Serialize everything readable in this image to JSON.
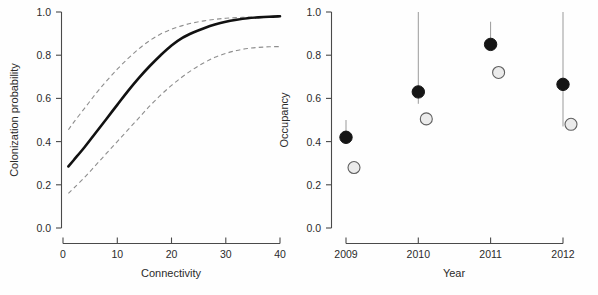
{
  "figure": {
    "background": "#fefefe",
    "panels": [
      "colonization-panel",
      "occupancy-panel"
    ]
  },
  "chart_data": [
    {
      "type": "line",
      "panel": "left",
      "title": "",
      "xlabel": "Connectivity",
      "ylabel": "Colonization probability",
      "xlim": [
        0,
        40
      ],
      "ylim": [
        0,
        1
      ],
      "xticks": [
        0,
        10,
        20,
        30,
        40
      ],
      "xtick_labels": [
        "0",
        "10",
        "20",
        "30",
        "40"
      ],
      "yticks": [
        0.0,
        0.2,
        0.4,
        0.6,
        0.8,
        1.0
      ],
      "ytick_labels": [
        "0.0",
        "0.2",
        "0.4",
        "0.6",
        "0.8",
        "1.0"
      ],
      "grid": false,
      "legend": "none",
      "series": [
        {
          "name": "fitted colonization probability",
          "style": "solid",
          "color": "#111111",
          "x": [
            1,
            2,
            4,
            6,
            8,
            10,
            12,
            14,
            16,
            18,
            20,
            22,
            24,
            26,
            28,
            30,
            32,
            34,
            36,
            38,
            40
          ],
          "y": [
            0.285,
            0.315,
            0.375,
            0.44,
            0.505,
            0.57,
            0.635,
            0.695,
            0.75,
            0.8,
            0.845,
            0.88,
            0.905,
            0.925,
            0.942,
            0.955,
            0.964,
            0.971,
            0.975,
            0.978,
            0.98
          ]
        },
        {
          "name": "upper 95% confidence limit",
          "style": "dashed",
          "color": "#8e8e8e",
          "x": [
            1,
            2,
            4,
            6,
            8,
            10,
            12,
            14,
            16,
            18,
            20,
            22,
            24,
            26,
            28,
            30,
            32,
            34,
            36,
            38,
            40
          ],
          "y": [
            0.455,
            0.49,
            0.555,
            0.62,
            0.68,
            0.735,
            0.785,
            0.83,
            0.868,
            0.898,
            0.92,
            0.937,
            0.95,
            0.959,
            0.966,
            0.971,
            0.974,
            0.976,
            0.978,
            0.979,
            0.98
          ]
        },
        {
          "name": "lower 95% confidence limit",
          "style": "dashed",
          "color": "#8e8e8e",
          "x": [
            1,
            2,
            4,
            6,
            8,
            10,
            12,
            14,
            16,
            18,
            20,
            22,
            24,
            26,
            28,
            30,
            32,
            34,
            36,
            38,
            40
          ],
          "y": [
            0.16,
            0.185,
            0.235,
            0.29,
            0.345,
            0.4,
            0.455,
            0.51,
            0.565,
            0.615,
            0.66,
            0.7,
            0.735,
            0.765,
            0.79,
            0.808,
            0.822,
            0.831,
            0.836,
            0.839,
            0.84
          ]
        }
      ]
    },
    {
      "type": "scatter",
      "panel": "right",
      "title": "",
      "xlabel": "Year",
      "ylabel": "Occupancy",
      "categories": [
        "2009",
        "2010",
        "2011",
        "2012"
      ],
      "xtick_labels": [
        "2009",
        "2010",
        "2011",
        "2012"
      ],
      "ylim": [
        0,
        1
      ],
      "yticks": [
        0.0,
        0.2,
        0.4,
        0.6,
        0.8,
        1.0
      ],
      "ytick_labels": [
        "0.0",
        "0.2",
        "0.4",
        "0.6",
        "0.8",
        "1.0"
      ],
      "grid": false,
      "legend": "none",
      "series": [
        {
          "name": "estimated occupancy",
          "marker": "filled-circle",
          "color": "#151515",
          "values": [
            0.42,
            0.63,
            0.85,
            0.665
          ],
          "error_low": [
            0.395,
            0.575,
            0.825,
            0.47
          ],
          "error_high": [
            0.5,
            1.0,
            0.955,
            1.0
          ]
        },
        {
          "name": "naive occupancy",
          "marker": "open-circle",
          "color": "#ebebeb",
          "values": [
            0.28,
            0.505,
            0.72,
            0.48
          ]
        }
      ]
    }
  ],
  "left_panel": {
    "y_axis_title": "Colonization probability",
    "x_axis_title": "Connectivity",
    "y_tick_labels": [
      "1.0",
      "0.8",
      "0.6",
      "0.4",
      "0.2",
      "0.0"
    ],
    "x_tick_labels": [
      "0",
      "10",
      "20",
      "30",
      "40"
    ]
  },
  "right_panel": {
    "y_axis_title": "Occupancy",
    "x_axis_title": "Year",
    "y_tick_labels": [
      "1.0",
      "0.8",
      "0.6",
      "0.4",
      "0.2",
      "0.0"
    ],
    "x_tick_labels": [
      "2009",
      "2010",
      "2011",
      "2012"
    ]
  }
}
